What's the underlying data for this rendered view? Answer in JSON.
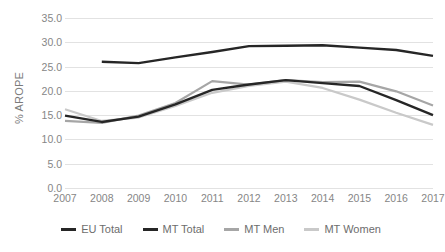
{
  "chart_data": {
    "type": "line",
    "title": "",
    "xlabel": "",
    "ylabel": "% AROPE",
    "ylim": [
      0.0,
      35.0
    ],
    "ytick_step": 5.0,
    "yticks": [
      "0.0",
      "5.0",
      "10.0",
      "15.0",
      "20.0",
      "25.0",
      "30.0",
      "35.0"
    ],
    "grid": true,
    "legend_position": "bottom",
    "categories": [
      "2007",
      "2008",
      "2009",
      "2010",
      "2011",
      "2012",
      "2013",
      "2014",
      "2015",
      "2016",
      "2017"
    ],
    "series": [
      {
        "name": "EU Total",
        "color": "#262626",
        "width": 2.4,
        "values": [
          null,
          26.0,
          25.7,
          26.9,
          28.0,
          29.2,
          29.3,
          29.4,
          28.9,
          28.4,
          27.2
        ]
      },
      {
        "name": "MT Total",
        "color": "#262626",
        "width": 2.4,
        "values": [
          14.9,
          13.6,
          14.7,
          17.2,
          20.2,
          21.3,
          22.2,
          21.6,
          21.0,
          18.1,
          15.0
        ]
      },
      {
        "name": "MT Men",
        "color": "#a6a6a6",
        "width": 2.2,
        "values": [
          13.8,
          13.4,
          14.9,
          17.5,
          22.0,
          21.3,
          22.2,
          21.8,
          21.9,
          19.9,
          17.0
        ]
      },
      {
        "name": "MT Women",
        "color": "#c9c9c9",
        "width": 2.2,
        "values": [
          16.2,
          13.8,
          14.5,
          16.9,
          19.6,
          21.0,
          21.9,
          20.6,
          18.2,
          15.5,
          13.0
        ]
      }
    ]
  },
  "legend": {
    "items": [
      {
        "label": "EU Total",
        "color": "#262626"
      },
      {
        "label": "MT Total",
        "color": "#262626"
      },
      {
        "label": "MT Men",
        "color": "#a6a6a6"
      },
      {
        "label": "MT Women",
        "color": "#c9c9c9"
      }
    ]
  },
  "axis": {
    "y_title": "% AROPE"
  }
}
